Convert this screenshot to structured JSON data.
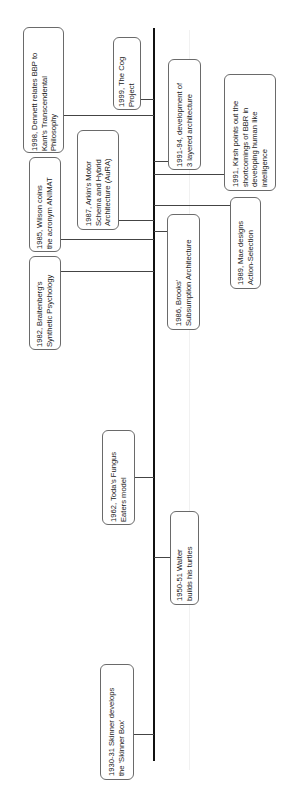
{
  "diagram": {
    "type": "timeline",
    "orientation": "vertical, text rotated 90deg counter-clockwise",
    "axis_color": "#111111",
    "box_border_color": "#6a6a6a",
    "events": [
      {
        "id": "dennett",
        "year": "1998",
        "text": "1998, Dennett relates BBP to\nKant's Transcendental\nPhilosophy"
      },
      {
        "id": "cog",
        "year": "1999",
        "text": "1999, The Cog\nProject"
      },
      {
        "id": "layered",
        "year": "1991-94",
        "text": "1991-94, development of\n3 layered architecture"
      },
      {
        "id": "kirsh",
        "year": "1991",
        "text": "1991, Kirsh points out the\nshortcomings of BBR in\ndeveloping human like\nintelligence"
      },
      {
        "id": "wilson",
        "year": "1985",
        "text": "1985, Wilson coins\nthe acronym ANIMAT"
      },
      {
        "id": "arkin",
        "year": "1987",
        "text": "1987, Arkin's Motor\nSchema and Hybrid\nArchitecture (AuRA)"
      },
      {
        "id": "mae",
        "year": "1989",
        "text": "1989, Mae designs\nAction-Selection"
      },
      {
        "id": "braitenberg",
        "year": "1982",
        "text": "1982, Braitenberg's\nSynthetic Psychology"
      },
      {
        "id": "brooks",
        "year": "1986",
        "text": "1986, Brooks'\nSubsumption Architecture"
      },
      {
        "id": "toda",
        "year": "1962",
        "text": "1962, Toda's Fungus\nEaters model"
      },
      {
        "id": "walter",
        "year": "1950-51",
        "text": "1950-51 Walter\nbuilds his turtles"
      },
      {
        "id": "skinner",
        "year": "1930-31",
        "text": "1930-31 Skinner develops\nthe 'Skinner Box'"
      }
    ]
  }
}
